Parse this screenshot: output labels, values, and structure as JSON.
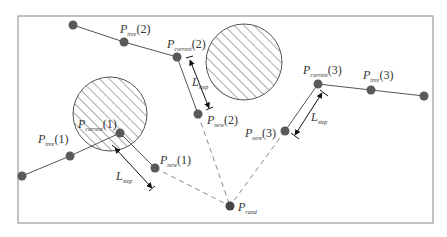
{
  "diagram": {
    "type": "RRT multi-tree expansion",
    "colors": {
      "frame": "#9a9a9a",
      "node": "#595959",
      "edge": "#555555",
      "dashed": "#8a8a8a",
      "hatch": "#555555"
    },
    "labels": {
      "p": "P",
      "tree1_sub": "tree",
      "tree1_idx": "(1)",
      "tree2_sub": "tree",
      "tree2_idx": "(2)",
      "tree3_sub": "tree",
      "tree3_idx": "(3)",
      "cur1_sub": "current",
      "cur1_idx": "(1)",
      "cur2_sub": "current",
      "cur2_idx": "(2)",
      "cur3_sub": "current",
      "cur3_idx": "(3)",
      "new1_sub": "new",
      "new1_idx": "(1)",
      "new2_sub": "new",
      "new2_idx": "(2)",
      "new3_sub": "new",
      "new3_idx": "(3)",
      "rand_sub": "rand",
      "L": "L",
      "step_sub": "step"
    },
    "obstacles": [
      {
        "name": "obstacle-left",
        "cx": 110,
        "cy": 114,
        "r": 37
      },
      {
        "name": "obstacle-right",
        "cx": 244,
        "cy": 62,
        "r": 38
      }
    ],
    "trees": [
      {
        "name": "tree-1",
        "nodes": [
          [
            22,
            176
          ],
          [
            70,
            156
          ],
          [
            120,
            133
          ]
        ],
        "new": [
          155,
          168
        ]
      },
      {
        "name": "tree-2",
        "nodes": [
          [
            73,
            25
          ],
          [
            124,
            42
          ],
          [
            177,
            57
          ]
        ],
        "new": [
          198,
          114
        ]
      },
      {
        "name": "tree-3",
        "nodes": [
          [
            424,
            96
          ],
          [
            371,
            90
          ],
          [
            318,
            84
          ]
        ],
        "new": [
          285,
          131
        ]
      }
    ],
    "rand": [
      230,
      206
    ]
  }
}
